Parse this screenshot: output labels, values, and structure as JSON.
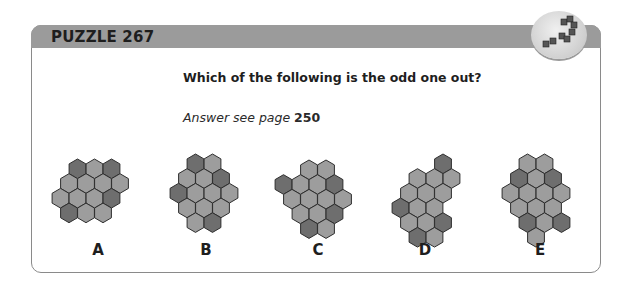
{
  "header": {
    "title": "PUZZLE 267",
    "icon": "cube-steps-icon"
  },
  "question": "Which of the following is the odd one out?",
  "answer": {
    "prefix": "Answer see page",
    "page": "250"
  },
  "colors": {
    "dark": "#6e6e6e",
    "light": "#9d9d9d",
    "outline": "#2e2e2e",
    "header": "#9b9b9b"
  },
  "figures": [
    {
      "label": "A",
      "x": 50,
      "y": 157,
      "rows": [
        {
          "off": 2,
          "cells": [
            "D",
            "L",
            "D"
          ]
        },
        {
          "off": 1,
          "cells": [
            "L",
            "L",
            "L",
            "L"
          ]
        },
        {
          "off": 0,
          "cells": [
            "L",
            "L",
            "L",
            "D"
          ]
        },
        {
          "off": 1,
          "cells": [
            "D",
            "L",
            "L"
          ]
        }
      ]
    },
    {
      "label": "B",
      "x": 168,
      "y": 152,
      "rows": [
        {
          "off": 2,
          "cells": [
            "D",
            "L"
          ]
        },
        {
          "off": 1,
          "cells": [
            "L",
            "L",
            "D"
          ]
        },
        {
          "off": 0,
          "cells": [
            "D",
            "L",
            "L",
            "L"
          ]
        },
        {
          "off": 1,
          "cells": [
            "L",
            "L",
            "L"
          ]
        },
        {
          "off": 2,
          "cells": [
            "L",
            "D"
          ]
        }
      ]
    },
    {
      "label": "C",
      "x": 273,
      "y": 158,
      "rows": [
        {
          "off": 3,
          "cells": [
            "L",
            "L"
          ]
        },
        {
          "off": 0,
          "cells": [
            "D",
            "L",
            "L",
            "D"
          ]
        },
        {
          "off": 1,
          "cells": [
            "L",
            "L",
            "L",
            "L"
          ]
        },
        {
          "off": 2,
          "cells": [
            "L",
            "L",
            "D"
          ]
        },
        {
          "off": 3,
          "cells": [
            "D",
            "L"
          ]
        }
      ]
    },
    {
      "label": "D",
      "x": 390,
      "y": 152,
      "rows": [
        {
          "off": 5,
          "cells": [
            "D"
          ]
        },
        {
          "off": 2,
          "cells": [
            "L",
            "L",
            "L"
          ]
        },
        {
          "off": 1,
          "cells": [
            "L",
            "L",
            "L"
          ]
        },
        {
          "off": 0,
          "cells": [
            "D",
            "L",
            "L"
          ]
        },
        {
          "off": 1,
          "cells": [
            "L",
            "L",
            "D"
          ]
        },
        {
          "off": 2,
          "cells": [
            "D",
            "L"
          ]
        }
      ]
    },
    {
      "label": "E",
      "x": 500,
      "y": 152,
      "rows": [
        {
          "off": 2,
          "cells": [
            "L",
            "L"
          ]
        },
        {
          "off": 1,
          "cells": [
            "D",
            "L",
            "D"
          ]
        },
        {
          "off": 0,
          "cells": [
            "L",
            "L",
            "L",
            "L"
          ]
        },
        {
          "off": 1,
          "cells": [
            "L",
            "L",
            "L"
          ]
        },
        {
          "off": 2,
          "cells": [
            "D",
            "L",
            "D"
          ]
        },
        {
          "off": 3,
          "cells": [
            "L"
          ]
        }
      ]
    }
  ]
}
